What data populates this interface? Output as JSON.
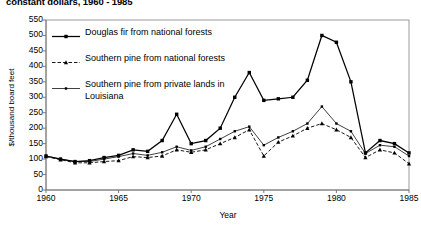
{
  "chart_title": "constant dollars, 1960 - 1985",
  "axes": {
    "ylabel": "$/thousand board feet",
    "xlabel": "Year",
    "yticks": [
      "0",
      "50",
      "100",
      "150",
      "200",
      "250",
      "300",
      "350",
      "400",
      "450",
      "500",
      "550"
    ],
    "xticks": [
      "1960",
      "1965",
      "1970",
      "1975",
      "1980",
      "1985"
    ]
  },
  "legend": {
    "items": [
      {
        "label": "Douglas fir from national forests",
        "marker": "square",
        "style": "solid-thick"
      },
      {
        "label": "Southern pine from national forests",
        "marker": "triangle",
        "style": "dashed"
      },
      {
        "label": "Southern pine from private lands in Louisiana",
        "marker": "dot",
        "style": "solid-thin"
      }
    ]
  },
  "chart_data": {
    "type": "line",
    "title": "constant dollars, 1960 - 1985",
    "xlabel": "Year",
    "ylabel": "$/thousand board feet",
    "xlim": [
      1960,
      1985
    ],
    "ylim": [
      0,
      550
    ],
    "grid": false,
    "legend_position": "upper-left",
    "x": [
      1960,
      1961,
      1962,
      1963,
      1964,
      1965,
      1966,
      1967,
      1968,
      1969,
      1970,
      1971,
      1972,
      1973,
      1974,
      1975,
      1976,
      1977,
      1978,
      1979,
      1980,
      1981,
      1982,
      1983,
      1984,
      1985
    ],
    "series": [
      {
        "name": "Douglas fir from national forests",
        "color": "#000000",
        "marker": "square",
        "style": "solid-thick",
        "values": [
          110,
          100,
          92,
          95,
          105,
          112,
          130,
          125,
          160,
          245,
          150,
          160,
          200,
          300,
          380,
          290,
          295,
          300,
          355,
          500,
          478,
          350,
          120,
          160,
          150,
          120
        ]
      },
      {
        "name": "Southern pine from national forests",
        "color": "#000000",
        "marker": "triangle",
        "style": "dashed",
        "values": [
          108,
          98,
          88,
          88,
          92,
          95,
          108,
          105,
          110,
          130,
          122,
          130,
          150,
          170,
          195,
          110,
          155,
          175,
          200,
          215,
          195,
          170,
          105,
          130,
          120,
          85
        ]
      },
      {
        "name": "Southern pine from private lands in Louisiana",
        "color": "#000000",
        "marker": "dot",
        "style": "solid-thin",
        "values": [
          110,
          100,
          92,
          92,
          100,
          108,
          118,
          112,
          122,
          140,
          128,
          140,
          165,
          190,
          205,
          145,
          170,
          190,
          215,
          270,
          215,
          190,
          118,
          145,
          140,
          110
        ]
      }
    ]
  }
}
